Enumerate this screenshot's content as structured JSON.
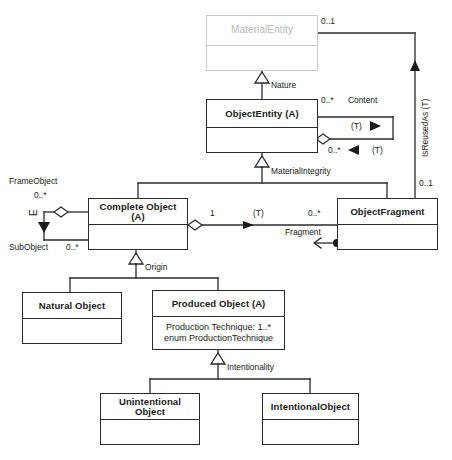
{
  "diagram": {
    "type": "uml-class-diagram",
    "colors": {
      "stroke": "#2b2b2b",
      "ghost_stroke": "#c9c9c9",
      "ghost_text": "#b9b9b9",
      "background": "#ffffff",
      "text": "#1a1a1a"
    }
  },
  "classes": [
    {
      "id": "material-entity",
      "name": "MaterialEntity",
      "abstract": false,
      "ghost": true,
      "attributes": [],
      "x": 206,
      "y": 15,
      "w": 112,
      "h": 56,
      "header_h": 30
    },
    {
      "id": "object-entity",
      "name": "ObjectEntity (A)",
      "abstract": true,
      "ghost": false,
      "attributes": [],
      "x": 206,
      "y": 99,
      "w": 112,
      "h": 54,
      "header_h": 28
    },
    {
      "id": "complete-object",
      "name": "Complete Object  (A)",
      "abstract": true,
      "ghost": false,
      "attributes": [],
      "x": 88,
      "y": 198,
      "w": 100,
      "h": 52,
      "header_h": 26
    },
    {
      "id": "object-fragment",
      "name": "ObjectFragment",
      "abstract": false,
      "ghost": false,
      "attributes": [],
      "x": 337,
      "y": 198,
      "w": 101,
      "h": 52,
      "header_h": 26
    },
    {
      "id": "natural-object",
      "name": "Natural Object",
      "abstract": false,
      "ghost": false,
      "attributes": [],
      "x": 22,
      "y": 292,
      "w": 100,
      "h": 52,
      "header_h": 26
    },
    {
      "id": "produced-object",
      "name": "Produced Object  (A)",
      "abstract": true,
      "ghost": false,
      "attributes": [
        "Production Technique: 1..*",
        "enum ProductionTechnique"
      ],
      "x": 152,
      "y": 290,
      "w": 133,
      "h": 60,
      "header_h": 26
    },
    {
      "id": "unintentional-object",
      "name": "Unintentional Object",
      "abstract": false,
      "ghost": false,
      "attributes": [],
      "x": 100,
      "y": 393,
      "w": 100,
      "h": 52,
      "header_h": 26
    },
    {
      "id": "intentional-object",
      "name": "IntentionalObject",
      "abstract": false,
      "ghost": false,
      "attributes": [],
      "x": 262,
      "y": 393,
      "w": 97,
      "h": 52,
      "header_h": 26
    }
  ],
  "relations": [
    {
      "id": "nature",
      "kind": "generalization",
      "label": "Nature",
      "from": "object-entity",
      "to": "material-entity"
    },
    {
      "id": "material-integrity",
      "kind": "generalization",
      "label": "MaterialIntegrity",
      "from": [
        "complete-object",
        "object-fragment"
      ],
      "to": "object-entity"
    },
    {
      "id": "origin",
      "kind": "generalization",
      "label": "Origin",
      "from": [
        "natural-object",
        "produced-object"
      ],
      "to": "complete-object"
    },
    {
      "id": "intentionality",
      "kind": "generalization",
      "label": "Intentionality",
      "from": [
        "unintentional-object",
        "intentional-object"
      ],
      "to": "produced-object"
    },
    {
      "id": "content",
      "kind": "aggregation",
      "label": "Content",
      "from": "object-entity",
      "to": "object-entity",
      "source_multiplicity": "0..*",
      "target_multiplicity": "0..*",
      "source_role": "(T)",
      "target_role": "(T)"
    },
    {
      "id": "frame-sub-object",
      "kind": "aggregation",
      "label_from": "FrameObject",
      "label_to": "SubObject",
      "from": "complete-object",
      "to": "complete-object",
      "source_multiplicity": "0..*",
      "target_multiplicity": "0..*",
      "role": "(T)"
    },
    {
      "id": "fragment",
      "kind": "aggregation",
      "label": "Fragment",
      "from": "complete-object",
      "to": "object-fragment",
      "source_multiplicity": "1",
      "target_multiplicity": "0..*",
      "role": "(T)"
    },
    {
      "id": "is-reused-as",
      "kind": "association",
      "label": "IsReusedAs (T)",
      "from": "object-fragment",
      "to": "material-entity",
      "source_multiplicity": "0..1",
      "target_multiplicity": "0..1"
    }
  ],
  "labels": {
    "nature": "Nature",
    "content": "Content",
    "material_integrity": "MaterialIntegrity",
    "is_reused_as": "IsReusedAs (T)",
    "frame_object": "FrameObject",
    "sub_object": "SubObject",
    "fragment": "Fragment",
    "origin": "Origin",
    "intentionality": "Intentionality",
    "role_t": "(T)",
    "role_e": "E"
  },
  "multiplicities": {
    "material_entity_right": "0..1",
    "content_top": "0..*",
    "content_bottom": "0..*",
    "object_fragment_top": "0..1",
    "frame_object": "0..*",
    "sub_object": "0..*",
    "complete_object_fragment_src": "1",
    "object_fragment_tgt": "0..*"
  }
}
